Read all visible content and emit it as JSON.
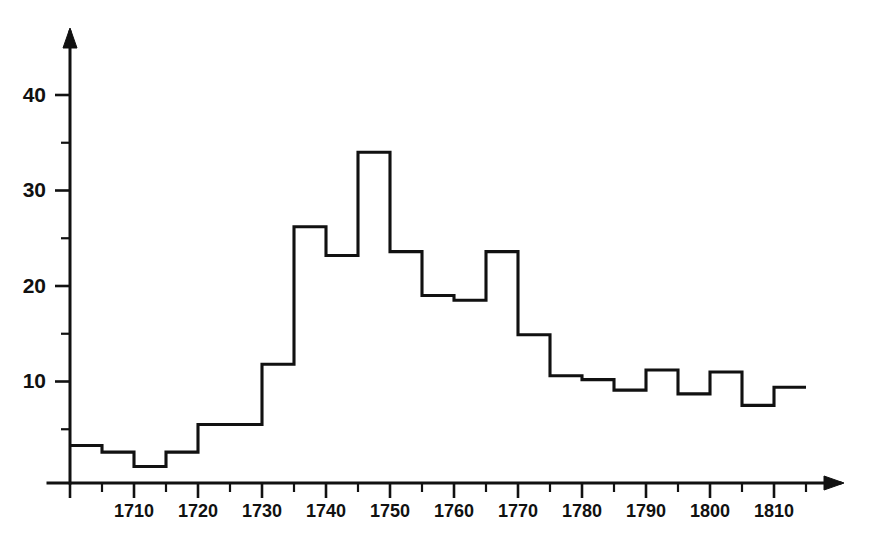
{
  "chart_data": {
    "type": "line",
    "subtype": "step",
    "title": "",
    "subtitle": "",
    "xlabel": "",
    "ylabel": "",
    "xlim": [
      1700,
      1816
    ],
    "ylim": [
      0,
      44
    ],
    "grid": false,
    "legend": null,
    "x_tick_labels": [
      "1710",
      "1720",
      "1730",
      "1740",
      "1750",
      "1760",
      "1770",
      "1780",
      "1790",
      "1800",
      "1810"
    ],
    "x_ticks_major": [
      1710,
      1720,
      1730,
      1740,
      1750,
      1760,
      1770,
      1780,
      1790,
      1800,
      1810
    ],
    "x_ticks_minor": [
      1705,
      1715,
      1725,
      1735,
      1745,
      1755,
      1765,
      1775,
      1785,
      1795,
      1805,
      1815
    ],
    "y_tick_labels": [
      "10",
      "20",
      "30",
      "40"
    ],
    "y_ticks_major": [
      10,
      20,
      30,
      40
    ],
    "y_ticks_minor": [
      5,
      15,
      25,
      35
    ],
    "x_axis_arrow": true,
    "y_axis_arrow": true,
    "bin_width": 5,
    "categories": [
      "1700-1705",
      "1705-1710",
      "1710-1715",
      "1715-1720",
      "1720-1725",
      "1725-1730",
      "1730-1735",
      "1735-1740",
      "1740-1745",
      "1745-1750",
      "1750-1755",
      "1755-1760",
      "1760-1765",
      "1765-1770",
      "1770-1775",
      "1775-1780",
      "1780-1785",
      "1785-1790",
      "1790-1795",
      "1795-1800",
      "1800-1805",
      "1805-1810",
      "1810-1815"
    ],
    "series": [
      {
        "name": "value",
        "color": "#111111",
        "x_start": [
          1700,
          1705,
          1710,
          1715,
          1720,
          1725,
          1730,
          1735,
          1740,
          1745,
          1750,
          1755,
          1760,
          1765,
          1770,
          1775,
          1780,
          1785,
          1790,
          1795,
          1800,
          1805,
          1810
        ],
        "x_end": [
          1705,
          1710,
          1715,
          1720,
          1725,
          1730,
          1735,
          1740,
          1745,
          1750,
          1755,
          1760,
          1765,
          1770,
          1775,
          1780,
          1785,
          1790,
          1795,
          1800,
          1805,
          1810,
          1815
        ],
        "values": [
          3.3,
          2.6,
          1.1,
          2.6,
          5.5,
          5.5,
          11.8,
          26.2,
          23.2,
          34.0,
          23.6,
          19.0,
          18.5,
          23.6,
          14.9,
          10.6,
          10.2,
          9.1,
          11.2,
          8.7,
          11.0,
          7.5,
          9.4
        ]
      }
    ]
  },
  "axis_colors": {
    "axis": "#111111",
    "plot_line": "#111111",
    "background": "#ffffff"
  }
}
